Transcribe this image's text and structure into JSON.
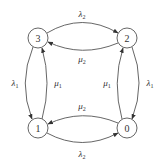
{
  "diagram": {
    "type": "state-transition",
    "nodes": [
      {
        "id": "3",
        "label": "3",
        "x": 38,
        "y": 38
      },
      {
        "id": "2",
        "label": "2",
        "x": 127,
        "y": 38
      },
      {
        "id": "1",
        "label": "1",
        "x": 38,
        "y": 128
      },
      {
        "id": "0",
        "label": "0",
        "x": 127,
        "y": 128
      }
    ],
    "edges": [
      {
        "from": "3",
        "to": "2",
        "label": "λ",
        "sub": "2"
      },
      {
        "from": "2",
        "to": "3",
        "label": "μ",
        "sub": "2"
      },
      {
        "from": "3",
        "to": "1",
        "label": "λ",
        "sub": "1"
      },
      {
        "from": "1",
        "to": "3",
        "label": "μ",
        "sub": "1"
      },
      {
        "from": "0",
        "to": "2",
        "label": "μ",
        "sub": "1"
      },
      {
        "from": "2",
        "to": "0",
        "label": "λ",
        "sub": "1"
      },
      {
        "from": "0",
        "to": "1",
        "label": "μ",
        "sub": "2"
      },
      {
        "from": "1",
        "to": "0",
        "label": "λ",
        "sub": "2"
      }
    ]
  }
}
